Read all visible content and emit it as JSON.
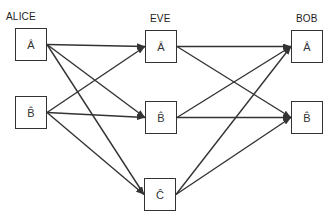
{
  "columns": [
    {
      "id": "alice",
      "label": "ALICE"
    },
    {
      "id": "eve",
      "label": "EVE"
    },
    {
      "id": "bob",
      "label": "BOB"
    }
  ],
  "nodes": [
    {
      "id": "alice-a",
      "column": "alice",
      "label": "Â",
      "x": 15,
      "y": 28
    },
    {
      "id": "alice-b",
      "column": "alice",
      "label": "B̂",
      "x": 15,
      "y": 96
    },
    {
      "id": "eve-a",
      "column": "eve",
      "label": "Â",
      "x": 145,
      "y": 30
    },
    {
      "id": "eve-b",
      "column": "eve",
      "label": "B̂",
      "x": 145,
      "y": 101
    },
    {
      "id": "eve-c",
      "column": "eve",
      "label": "Ĉ",
      "x": 144,
      "y": 178
    },
    {
      "id": "bob-a",
      "column": "bob",
      "label": "Â",
      "x": 291,
      "y": 30
    },
    {
      "id": "bob-b",
      "column": "bob",
      "label": "B̂",
      "x": 291,
      "y": 101
    }
  ],
  "edges": [
    {
      "from": "alice-a",
      "to": "eve-a"
    },
    {
      "from": "alice-a",
      "to": "eve-b"
    },
    {
      "from": "alice-a",
      "to": "eve-c"
    },
    {
      "from": "alice-b",
      "to": "eve-a"
    },
    {
      "from": "alice-b",
      "to": "eve-b"
    },
    {
      "from": "alice-b",
      "to": "eve-c"
    },
    {
      "from": "eve-a",
      "to": "bob-a"
    },
    {
      "from": "eve-a",
      "to": "bob-b"
    },
    {
      "from": "eve-b",
      "to": "bob-a"
    },
    {
      "from": "eve-b",
      "to": "bob-b"
    },
    {
      "from": "eve-c",
      "to": "bob-a"
    },
    {
      "from": "eve-c",
      "to": "bob-b"
    }
  ],
  "colors": {
    "stroke": "#333333",
    "text": "#222222",
    "background": "#ffffff"
  }
}
